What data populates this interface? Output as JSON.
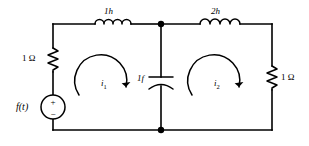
{
  "figure": {
    "background_color": "#ffffff",
    "line_color": "#000000"
  },
  "labels": {
    "resistor_left": "1 Ω",
    "resistor_right": "1 Ω",
    "inductor_left": "1h",
    "inductor_right": "2h",
    "capacitor": "1f",
    "source": "f(t)",
    "source_plus": "+",
    "source_minus": "−",
    "mesh_current_left": "i",
    "mesh_current_left_sub": "1",
    "mesh_current_right": "i",
    "mesh_current_right_sub": "2"
  },
  "components": [
    {
      "name": "voltage-source",
      "kind": "source",
      "label": "f(t)"
    },
    {
      "name": "resistor-left",
      "kind": "resistor",
      "label": "1 Ω"
    },
    {
      "name": "inductor-left",
      "kind": "inductor",
      "label": "1h"
    },
    {
      "name": "capacitor-center",
      "kind": "capacitor",
      "label": "1f"
    },
    {
      "name": "inductor-right",
      "kind": "inductor",
      "label": "2h"
    },
    {
      "name": "resistor-right",
      "kind": "resistor",
      "label": "1 Ω"
    }
  ],
  "meshes": [
    {
      "name": "mesh-left",
      "label": "i1",
      "direction": "clockwise"
    },
    {
      "name": "mesh-right",
      "label": "i2",
      "direction": "clockwise"
    }
  ]
}
